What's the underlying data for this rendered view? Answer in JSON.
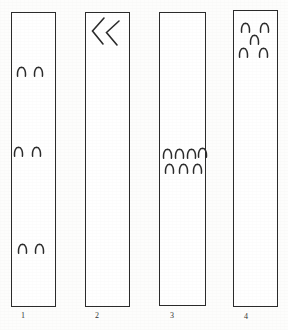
{
  "figure": {
    "type": "scientific-figure-strips",
    "background_color": "#fdfdfc",
    "ink_color": "#2b2b2b",
    "canvas": {
      "width": 288,
      "height": 330
    },
    "mark_glyph_name": "arch-mark",
    "mark_description": "small inverted-U (arch) ink mark",
    "strips": [
      {
        "id": "strip-1",
        "label": "1",
        "rect": {
          "x": 11,
          "y": 12,
          "width": 45,
          "height": 295
        },
        "label_pos": {
          "x": 23,
          "y": 311
        },
        "marks": [
          {
            "x": 16,
            "y": 66
          },
          {
            "x": 33,
            "y": 66
          },
          {
            "x": 13,
            "y": 146
          },
          {
            "x": 31,
            "y": 146
          },
          {
            "x": 17,
            "y": 243
          },
          {
            "x": 34,
            "y": 243
          }
        ],
        "mark_count": 6,
        "chevron": null
      },
      {
        "id": "strip-2",
        "label": "2",
        "rect": {
          "x": 85,
          "y": 12,
          "width": 45,
          "height": 295
        },
        "label_pos": {
          "x": 97,
          "y": 311
        },
        "marks": [],
        "mark_count": 0,
        "chevron": {
          "name": "double-chevron-left-icon",
          "x": 90,
          "y": 15,
          "width": 32,
          "height": 32
        }
      },
      {
        "id": "strip-3",
        "label": "3",
        "rect": {
          "x": 159,
          "y": 12,
          "width": 47,
          "height": 294
        },
        "label_pos": {
          "x": 172,
          "y": 311
        },
        "marks": [
          {
            "x": 162,
            "y": 148
          },
          {
            "x": 174,
            "y": 148
          },
          {
            "x": 186,
            "y": 148
          },
          {
            "x": 197,
            "y": 147
          },
          {
            "x": 164,
            "y": 163
          },
          {
            "x": 178,
            "y": 163
          },
          {
            "x": 192,
            "y": 163
          }
        ],
        "mark_count": 7,
        "chevron": null
      },
      {
        "id": "strip-4",
        "label": "4",
        "rect": {
          "x": 233,
          "y": 10,
          "width": 45,
          "height": 297
        },
        "label_pos": {
          "x": 246,
          "y": 312
        },
        "marks": [
          {
            "x": 240,
            "y": 22
          },
          {
            "x": 259,
            "y": 22
          },
          {
            "x": 249,
            "y": 34
          },
          {
            "x": 238,
            "y": 47
          },
          {
            "x": 258,
            "y": 47
          }
        ],
        "mark_count": 5,
        "chevron": null
      }
    ]
  }
}
